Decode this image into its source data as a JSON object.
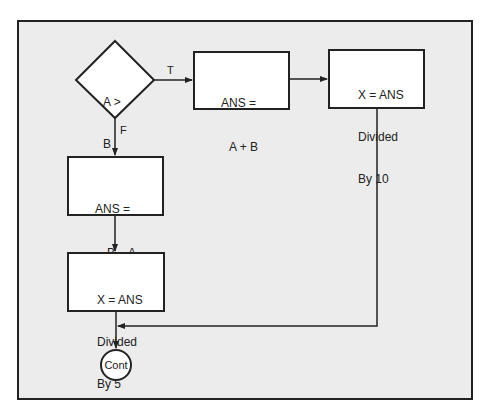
{
  "flowchart": {
    "decision": {
      "line1": "A >",
      "line2": "B"
    },
    "true_label": "T",
    "false_label": "F",
    "true_box": {
      "line1": "ANS =",
      "line2": "A + B"
    },
    "true_box2": {
      "line1": "X = ANS",
      "line2": "Divided",
      "line3": "By 10"
    },
    "false_box": {
      "line1": "ANS =",
      "line2": "B − A"
    },
    "false_box2": {
      "line1": "X = ANS",
      "line2": "Divided",
      "line3": "By 5"
    },
    "terminator": "Cont"
  },
  "colors": {
    "frame_bg": "#ececec",
    "stroke": "#222222",
    "box_bg": "#ffffff"
  }
}
